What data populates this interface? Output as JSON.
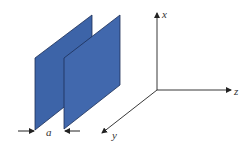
{
  "diagram": {
    "plate_color": "#3d64a8",
    "plate_edge_color": "#1c2f57",
    "axis_color": "#222222",
    "labels": {
      "gap": "a",
      "x_axis": "x",
      "y_axis": "y",
      "z_axis": "z"
    }
  }
}
